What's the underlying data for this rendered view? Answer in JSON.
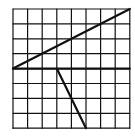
{
  "diagram": {
    "type": "grid-figure",
    "grid": {
      "cols": 8,
      "rows": 8,
      "origin_px": [
        13,
        9
      ],
      "cell_px": [
        14.6,
        14.9
      ]
    },
    "colors": {
      "background": "#ffffff",
      "line": "#111111"
    },
    "segments": [
      {
        "name": "diagonal-line",
        "from": [
          0,
          4
        ],
        "to": [
          8,
          0
        ]
      },
      {
        "name": "horizontal-line",
        "from": [
          0,
          4
        ],
        "to": [
          8,
          4
        ]
      },
      {
        "name": "slanted-line",
        "from": [
          3,
          4
        ],
        "to": [
          5,
          8
        ]
      }
    ]
  }
}
